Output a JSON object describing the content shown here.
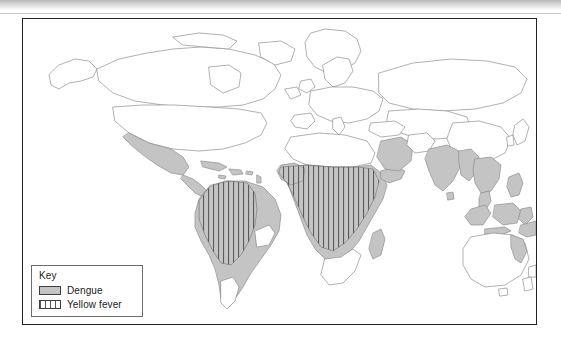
{
  "figure": {
    "type": "map",
    "frame": {
      "border_color": "#222222",
      "background": "#ffffff"
    }
  },
  "legend": {
    "title": "Key",
    "position": "bottom-left",
    "items": [
      {
        "label": "Dengue",
        "swatch": "solid-gray-fill",
        "color": "#c4c4c4",
        "pattern": "solid"
      },
      {
        "label": "Yellow fever",
        "swatch": "vertical-stripe-fill",
        "color": "#555555",
        "pattern": "vertical-stripes"
      }
    ]
  },
  "map_data": {
    "projection": "equirectangular",
    "outline_color": "#8f8f8f",
    "fills": {
      "dengue_color": "#c4c4c4",
      "yellow_fever_pattern": "vertical-stripes",
      "unaffected_color": "#ffffff"
    },
    "dengue_regions": [
      "Mexico",
      "Central America",
      "Caribbean islands",
      "Northern South America",
      "Brazil",
      "Bolivia",
      "Paraguay",
      "Northern Argentina",
      "West Africa",
      "Central Africa",
      "East Africa",
      "Sudan",
      "Madagascar coast",
      "Arabian Peninsula south",
      "India",
      "Sri Lanka",
      "Bangladesh",
      "Myanmar",
      "Thailand",
      "Vietnam",
      "Malaysia",
      "Indonesia",
      "Philippines",
      "Papua New Guinea",
      "Northeastern Australia",
      "Southern China"
    ],
    "yellow_fever_regions": [
      "Colombia",
      "Venezuela",
      "Ecuador",
      "Peru",
      "Bolivia",
      "Brazil interior",
      "Guyanas",
      "West Africa",
      "Central Africa",
      "East Africa",
      "Angola",
      "Zambia"
    ],
    "unaffected_regions": [
      "Canada",
      "United States",
      "Greenland",
      "Europe",
      "Russia",
      "Central Asia",
      "North Africa",
      "Southern Africa",
      "Southern Australia",
      "New Zealand",
      "Chile",
      "Southern Argentina",
      "Japan",
      "Korea"
    ]
  }
}
